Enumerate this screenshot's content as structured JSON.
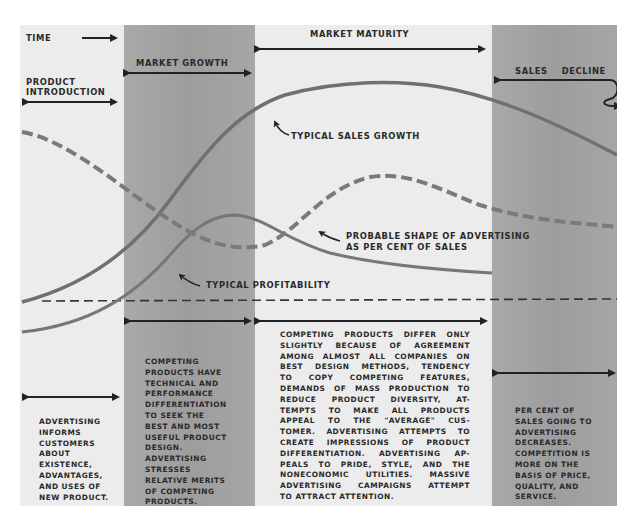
{
  "stages": {
    "time": "TIME",
    "introduction": [
      "PRODUCT",
      "INTRODUCTION"
    ],
    "growth": "MARKET GROWTH",
    "maturity": "MARKET MATURITY",
    "decline": "SALES    DECLINE"
  },
  "curves": {
    "sales": "TYPICAL SALES GROWTH",
    "advertising": [
      "PROBABLE SHAPE OF ADVERTISING",
      "AS PER CENT OF SALES"
    ],
    "profit": "TYPICAL PROFITABILITY"
  },
  "descriptions": {
    "introduction": [
      "ADVERTISING",
      "INFORMS",
      "CUSTOMERS",
      "ABOUT",
      "EXISTENCE,",
      "ADVANTAGES,",
      "AND USES OF",
      "NEW PRODUCT."
    ],
    "growth": [
      "COMPETING",
      "PRODUCTS HAVE",
      "TECHNICAL AND",
      "PERFORMANCE",
      "DIFFERENTIATION",
      "TO SEEK THE",
      "BEST AND MOST",
      "USEFUL PRODUCT",
      "DESIGN.",
      "ADVERTISING",
      "STRESSES",
      "RELATIVE MERITS",
      "OF COMPETING",
      "PRODUCTS."
    ],
    "maturity": [
      "COMPETING PRODUCTS DIFFER ONLY",
      "SLIGHTLY BECAUSE OF AGREEMENT",
      "AMONG ALMOST ALL COMPANIES ON",
      "BEST DESIGN METHODS, TENDENCY",
      "TO COPY COMPETING FEATURES,",
      "DEMANDS OF MASS PRODUCTION TO",
      "REDUCE PRODUCT DIVERSITY, AT-",
      "TEMPTS TO MAKE ALL PRODUCTS",
      "APPEAL TO THE \"AVERAGE\" CUS-",
      "TOMER. ADVERTISING ATTEMPTS TO",
      "CREATE IMPRESSIONS OF PRODUCT",
      "DIFFERENTIATION. ADVERTISING AP-",
      "PEALS TO PRIDE, STYLE, AND THE",
      "NONECONOMIC UTILITIES. MASSIVE",
      "ADVERTISING CAMPAIGNS ATTEMPT",
      "TO ATTRACT ATTENTION."
    ],
    "decline": [
      "PER CENT OF",
      "SALES GOING TO",
      "ADVERTISING",
      "DECREASES.",
      "COMPETITION IS",
      "MORE ON THE",
      "BASIS OF PRICE,",
      "QUALITY, AND",
      "SERVICE."
    ]
  },
  "colors": {
    "background": "#ececec",
    "band": "#a3a3a3",
    "curve": "#6e6e6e",
    "ink": "#2a2a2a"
  }
}
